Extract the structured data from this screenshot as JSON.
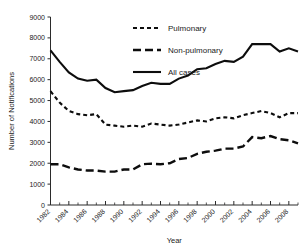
{
  "chart_data": {
    "type": "line",
    "title": "",
    "xlabel": "Year",
    "ylabel": "Number of Notifications",
    "xlim": [
      1982,
      2009
    ],
    "ylim": [
      0,
      9000
    ],
    "grid": false,
    "legend_position": "top-right",
    "x": [
      1982,
      1983,
      1984,
      1985,
      1986,
      1987,
      1988,
      1989,
      1990,
      1991,
      1992,
      1993,
      1994,
      1995,
      1996,
      1997,
      1998,
      1999,
      2000,
      2001,
      2002,
      2003,
      2004,
      2005,
      2006,
      2007,
      2008,
      2009
    ],
    "xticks": [
      1982,
      1984,
      1986,
      1988,
      1990,
      1992,
      1994,
      1996,
      1998,
      2000,
      2002,
      2004,
      2006,
      2008
    ],
    "xticklabels": [
      "1982",
      "1984",
      "1986",
      "1988",
      "1990",
      "1992",
      "1994",
      "1996",
      "1998",
      "2000",
      "2002",
      "2004",
      "2006",
      "2008"
    ],
    "yticks": [
      0,
      1000,
      2000,
      3000,
      4000,
      5000,
      6000,
      7000,
      8000,
      9000
    ],
    "yticklabels": [
      "0",
      "1000",
      "2000",
      "3000",
      "4000",
      "5000",
      "6000",
      "7000",
      "8000",
      "9000"
    ],
    "series": [
      {
        "name": "Pulmonary",
        "style": "dotted",
        "values": [
          5450,
          4900,
          4500,
          4350,
          4300,
          4350,
          3850,
          3800,
          3750,
          3800,
          3750,
          3900,
          3850,
          3800,
          3850,
          3950,
          4050,
          4000,
          4150,
          4200,
          4150,
          4300,
          4400,
          4500,
          4400,
          4200,
          4400,
          4400
        ]
      },
      {
        "name": "Non-pulmonary",
        "style": "dashed",
        "values": [
          1950,
          1950,
          1800,
          1700,
          1650,
          1650,
          1600,
          1600,
          1700,
          1700,
          1950,
          1980,
          1950,
          2000,
          2200,
          2250,
          2450,
          2550,
          2600,
          2700,
          2700,
          2800,
          3250,
          3200,
          3300,
          3150,
          3100,
          2950
        ]
      },
      {
        "name": "All cases",
        "style": "solid",
        "values": [
          7400,
          6850,
          6350,
          6050,
          5950,
          6000,
          5600,
          5400,
          5450,
          5500,
          5700,
          5850,
          5800,
          5800,
          6050,
          6200,
          6500,
          6550,
          6750,
          6900,
          6850,
          7100,
          7700,
          7700,
          7700,
          7350,
          7500,
          7350
        ]
      }
    ]
  },
  "legend": {
    "items": [
      {
        "label": "Pulmonary"
      },
      {
        "label": "Non-pulmonary"
      },
      {
        "label": "All cases"
      }
    ]
  },
  "axes": {
    "x_title": "Year",
    "y_title": "Number of Notifications"
  }
}
